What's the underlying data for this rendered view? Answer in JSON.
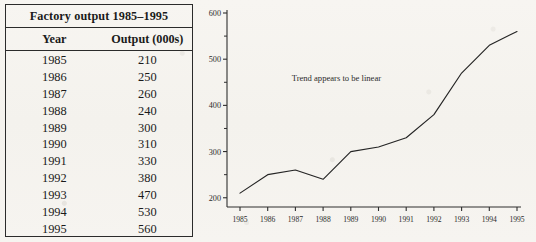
{
  "table": {
    "title": "Factory output 1985–1995",
    "columns": [
      "Year",
      "Output (000s)"
    ],
    "rows": [
      {
        "year": "1985",
        "output": "210"
      },
      {
        "year": "1986",
        "output": "250"
      },
      {
        "year": "1987",
        "output": "260"
      },
      {
        "year": "1988",
        "output": "240"
      },
      {
        "year": "1989",
        "output": "300"
      },
      {
        "year": "1990",
        "output": "310"
      },
      {
        "year": "1991",
        "output": "330"
      },
      {
        "year": "1992",
        "output": "380"
      },
      {
        "year": "1993",
        "output": "470"
      },
      {
        "year": "1994",
        "output": "530"
      },
      {
        "year": "1995",
        "output": "560"
      }
    ]
  },
  "chart_data": {
    "type": "line",
    "title": "",
    "xlabel": "",
    "ylabel": "",
    "categories": [
      "1985",
      "1986",
      "1987",
      "1988",
      "1989",
      "1990",
      "1991",
      "1992",
      "1993",
      "1994",
      "1995"
    ],
    "values": [
      210,
      250,
      260,
      240,
      300,
      310,
      330,
      380,
      470,
      530,
      560
    ],
    "series": [
      {
        "name": "Output (000s)",
        "values": [
          210,
          250,
          260,
          240,
          300,
          310,
          330,
          380,
          470,
          530,
          560
        ]
      }
    ],
    "ylim": [
      180,
      600
    ],
    "yticks": [
      200,
      300,
      400,
      500,
      600
    ],
    "yticks_minor": [
      250,
      350,
      450,
      550
    ],
    "ytick_labels": [
      "200",
      "300",
      "400",
      "500",
      "600"
    ],
    "xtick_labels": [
      "1985",
      "1986",
      "1987",
      "1988",
      "1989",
      "1990",
      "1991",
      "1992",
      "1993",
      "1994",
      "1995"
    ],
    "grid": false,
    "legend": "none",
    "annotations": [
      {
        "text": "Trend appears to be linear",
        "x": 1986.6,
        "y": 452
      }
    ],
    "line_color": "#242424"
  }
}
